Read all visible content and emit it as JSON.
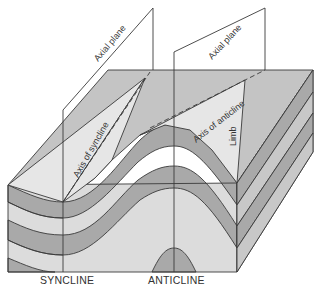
{
  "labels": {
    "syncline": "SYNCLINE",
    "anticline": "ANTICLINE",
    "axial_plane_left": "Axial plane",
    "axial_plane_right": "Axial plane",
    "axis_of_syncline": "Axis of syncline",
    "axis_of_anticline": "Axis of anticline",
    "limb": "Limb"
  },
  "colors": {
    "background": "#ffffff",
    "top_face": "#c4c4c4",
    "light_layer": "#dcdcdc",
    "dark_layer": "#a9a9a9",
    "plane_fill": "#e8e8e8",
    "line": "#3a3a3a"
  }
}
